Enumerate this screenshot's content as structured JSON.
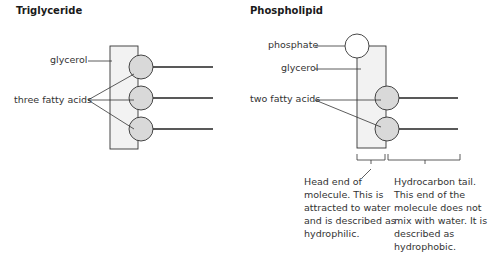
{
  "triglyceride": {
    "title": "Triglyceride",
    "labels": {
      "glycerol": "glycerol",
      "fatty_acids": "three fatty acids"
    }
  },
  "phospholipid": {
    "title": "Phospholipid",
    "labels": {
      "phosphate": "phosphate",
      "glycerol": "glycerol",
      "fatty_acids": "two fatty acids"
    },
    "head_caption": [
      "Head end of",
      "molecule. This is",
      "attracted to water",
      "and is described as",
      "hydrophilic."
    ],
    "tail_caption": [
      "Hydrocarbon tail.",
      "This end of the",
      "molecule does not",
      "mix with water. It is",
      "described as",
      "hydrophobic."
    ]
  },
  "colors": {
    "glycerol_fill": "#f2f2f2",
    "fatty_acid_fill": "#d9d9d9",
    "stroke": "#333333"
  }
}
